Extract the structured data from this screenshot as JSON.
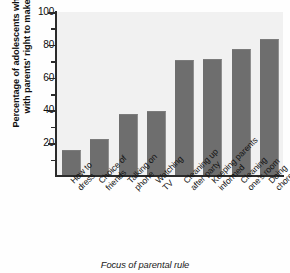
{
  "chart_data": {
    "type": "bar",
    "title": "",
    "xlabel": "Focus of parental rule",
    "ylabel_line1": "Percentage of adolescents who agree",
    "ylabel_line2": "with parents' right to make rule",
    "categories": [
      "How to dress",
      "Choice of friends",
      "Talking on phone",
      "Watching TV",
      "Cleaning up after party",
      "Keeping parents informed",
      "Cleaning one's room",
      "Doing chores"
    ],
    "category_lines": [
      [
        "How to",
        "dress"
      ],
      [
        "Choice of",
        "friends"
      ],
      [
        "Talking on",
        "phone"
      ],
      [
        "Watching",
        "TV"
      ],
      [
        "Cleaning up",
        "after party"
      ],
      [
        "Keeping parents",
        "informed"
      ],
      [
        "Cleaning",
        "one's room"
      ],
      [
        "Doing",
        "chores"
      ]
    ],
    "values": [
      15,
      22,
      37,
      39,
      70,
      71,
      77,
      83
    ],
    "ylim": [
      0,
      100
    ],
    "ytick_labels": [
      "100",
      "80",
      "60",
      "40",
      "20"
    ],
    "ytick_values": [
      100,
      80,
      60,
      40,
      20
    ],
    "yminor_values": [
      90,
      70,
      50,
      30,
      10
    ],
    "grid": false,
    "legend": "none",
    "bar_color": "#6e6e6e",
    "plot_background": "#f1f1f1",
    "axis_color": "#2b2b2b"
  }
}
